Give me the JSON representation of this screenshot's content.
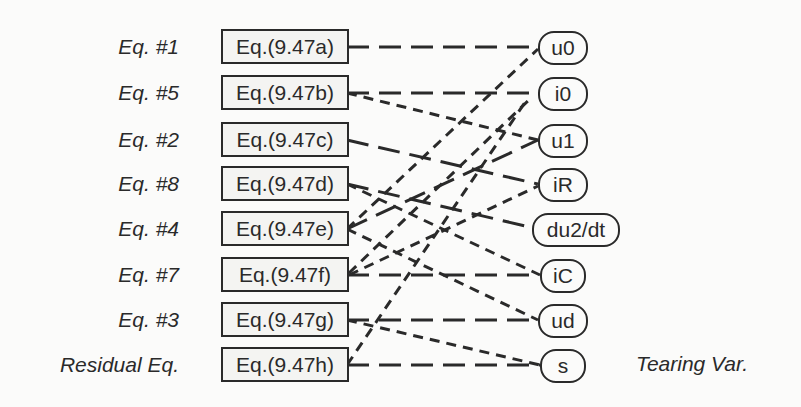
{
  "diagram": {
    "type": "bipartite-matching-graph",
    "equation_labels": [
      "Eq. #1",
      "Eq. #5",
      "Eq. #2",
      "Eq. #8",
      "Eq. #4",
      "Eq. #7",
      "Eq. #3",
      "Residual Eq."
    ],
    "equations": [
      "Eq.(9.47a)",
      "Eq.(9.47b)",
      "Eq.(9.47c)",
      "Eq.(9.47d)",
      "Eq.(9.47e)",
      "Eq.(9.47f)",
      "Eq.(9.47g)",
      "Eq.(9.47h)"
    ],
    "variables": [
      "u0",
      "i0",
      "u1",
      "iR",
      "du2/dt",
      "iC",
      "ud",
      "s"
    ],
    "tearing_label": "Tearing Var.",
    "edges": [
      {
        "from": "Eq.(9.47a)",
        "to": "u0",
        "style": "long-dash"
      },
      {
        "from": "Eq.(9.47b)",
        "to": "i0",
        "style": "long-dash"
      },
      {
        "from": "Eq.(9.47b)",
        "to": "u1",
        "style": "short-dash"
      },
      {
        "from": "Eq.(9.47c)",
        "to": "iR",
        "style": "long-dash"
      },
      {
        "from": "Eq.(9.47d)",
        "to": "du2/dt",
        "style": "long-dash"
      },
      {
        "from": "Eq.(9.47d)",
        "to": "iC",
        "style": "short-dash"
      },
      {
        "from": "Eq.(9.47e)",
        "to": "u0",
        "style": "short-dash"
      },
      {
        "from": "Eq.(9.47e)",
        "to": "u1",
        "style": "long-dash"
      },
      {
        "from": "Eq.(9.47e)",
        "to": "ud",
        "style": "short-dash"
      },
      {
        "from": "Eq.(9.47f)",
        "to": "iC",
        "style": "long-dash"
      },
      {
        "from": "Eq.(9.47f)",
        "to": "i0",
        "style": "short-dash"
      },
      {
        "from": "Eq.(9.47f)",
        "to": "iR",
        "style": "short-dash"
      },
      {
        "from": "Eq.(9.47g)",
        "to": "ud",
        "style": "long-dash"
      },
      {
        "from": "Eq.(9.47g)",
        "to": "s",
        "style": "short-dash"
      },
      {
        "from": "Eq.(9.47h)",
        "to": "s",
        "style": "long-dash"
      },
      {
        "from": "Eq.(9.47h)",
        "to": "i0",
        "style": "short-dash"
      }
    ],
    "colors": {
      "line": "#2a2a2a",
      "background": "#fbfbfa",
      "box_fill": "#f4f4f2"
    }
  }
}
